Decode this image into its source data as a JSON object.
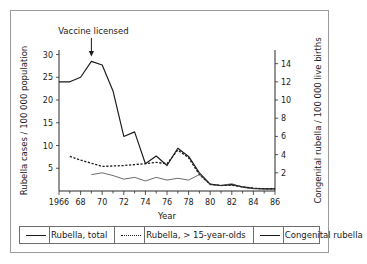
{
  "figure": {
    "annotation": {
      "text": "Vaccine licensed",
      "at_year": 1969,
      "arrow_icon": "down-arrow-icon"
    }
  },
  "legend": {
    "position": "below-plot",
    "entries": [
      {
        "label": "Rubella, total",
        "style": "solid",
        "swatch_icon": "solid-line-icon"
      },
      {
        "label": "Rubella, > 15-year-olds",
        "style": "dotted",
        "swatch_icon": "dotted-line-icon"
      },
      {
        "label": "Congenital rubella",
        "style": "thin-solid",
        "swatch_icon": "thin-solid-line-icon"
      }
    ]
  },
  "chart_data": {
    "type": "line",
    "title": "",
    "xlabel": "Year",
    "ylabel": "Rubella cases / 100 000 population",
    "y2label": "Congenital rubella / 100 000 live births",
    "xlim": [
      1966,
      1986
    ],
    "ylim": [
      0,
      31
    ],
    "y2lim": [
      0,
      15.5
    ],
    "grid": false,
    "x_ticks_major": [
      1966,
      1968,
      1970,
      1972,
      1974,
      1976,
      1978,
      1980,
      1982,
      1984,
      1986
    ],
    "x_ticklabels": [
      "1966",
      "68",
      "70",
      "72",
      "74",
      "76",
      "78",
      "80",
      "82",
      "84",
      "86"
    ],
    "x_ticks_minor": [
      1967,
      1969,
      1971,
      1973,
      1975,
      1977,
      1979,
      1981,
      1983,
      1985
    ],
    "y_ticks": [
      5,
      10,
      15,
      20,
      25,
      30
    ],
    "y_ticklabels": [
      "5",
      "10",
      "15",
      "20",
      "25",
      "30"
    ],
    "y2_ticks": [
      2,
      4,
      6,
      8,
      10,
      12,
      14
    ],
    "y2_ticklabels": [
      "2",
      "4",
      "6",
      "8",
      "10",
      "12",
      "14"
    ],
    "annotations": [
      {
        "text": "Vaccine licensed",
        "x": 1969,
        "y": 30,
        "arrow": true
      }
    ],
    "series": [
      {
        "name": "Rubella, total",
        "axis": "left",
        "style": "solid",
        "x": [
          1966,
          1967,
          1968,
          1969,
          1970,
          1971,
          1972,
          1973,
          1974,
          1975,
          1976,
          1977,
          1978,
          1979,
          1980,
          1981,
          1982,
          1983,
          1984,
          1985,
          1986
        ],
        "values": [
          24.0,
          24.0,
          25.0,
          28.5,
          27.7,
          22.0,
          12.0,
          13.0,
          6.0,
          7.7,
          5.6,
          9.4,
          7.6,
          4.0,
          1.5,
          1.2,
          1.4,
          0.9,
          0.6,
          0.5,
          0.5
        ]
      },
      {
        "name": "Rubella, > 15-year-olds",
        "axis": "left",
        "style": "dotted",
        "x": [
          1967,
          1968,
          1969,
          1970,
          1971,
          1972,
          1973,
          1974,
          1975,
          1976,
          1977,
          1978,
          1979,
          1980,
          1981,
          1982,
          1983,
          1984,
          1985,
          1986
        ],
        "values": [
          7.6,
          6.8,
          6.1,
          5.4,
          5.5,
          5.6,
          5.8,
          6.0,
          6.3,
          6.0,
          9.0,
          7.3,
          3.6,
          1.5,
          1.2,
          1.3,
          0.9,
          0.6,
          0.5,
          0.5
        ]
      },
      {
        "name": "Congenital rubella",
        "axis": "right",
        "style": "thin-solid",
        "x": [
          1969,
          1970,
          1971,
          1972,
          1973,
          1974,
          1975,
          1976,
          1977,
          1978,
          1979,
          1980,
          1981,
          1982,
          1983,
          1984,
          1985,
          1986
        ],
        "values": [
          1.8,
          2.0,
          1.7,
          1.3,
          1.5,
          1.1,
          1.5,
          1.2,
          1.4,
          1.2,
          1.8,
          0.7,
          0.6,
          0.8,
          0.4,
          0.25,
          0.2,
          0.2
        ]
      }
    ]
  }
}
